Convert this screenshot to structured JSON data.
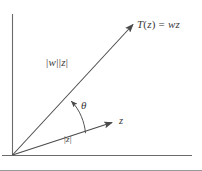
{
  "figure": {
    "type": "geometry-diagram",
    "background_color": "#ffffff",
    "stroke_color": "#5a5a5a",
    "text_color": "#3a3a3a",
    "border": {
      "bottom_rule_color": "#8c8c8c"
    }
  },
  "axes": {
    "origin": {
      "x": 12,
      "y": 155
    },
    "vertical": {
      "name": "imaginary-axis",
      "x": 12,
      "y_top": 14,
      "y_bottom": 155
    },
    "horizontal": {
      "name": "real-axis",
      "y": 155,
      "x_left": 2,
      "x_right": 192
    }
  },
  "vectors": [
    {
      "id": "tz",
      "name": "transformed-vector",
      "label": "T(z) = wz",
      "label_parts": {
        "t": "T",
        "open": "(",
        "z1": "z",
        "close": ")",
        "equals": " = ",
        "w": "w",
        "z2": "z"
      },
      "magnitude_label": "|w| |z|",
      "magnitude_parts": {
        "bar1": "|",
        "w": "w",
        "bar2": "|",
        "bar3": "|",
        "z": "z",
        "bar4": "|"
      },
      "from": {
        "x": 12,
        "y": 155
      },
      "to": {
        "x": 134,
        "y": 24
      }
    },
    {
      "id": "z",
      "name": "original-vector",
      "label": "z",
      "magnitude_label": "|z|",
      "magnitude_parts": {
        "bar1": "|",
        "z": "z",
        "bar2": "|"
      },
      "from": {
        "x": 12,
        "y": 155
      },
      "to": {
        "x": 114,
        "y": 122
      }
    }
  ],
  "angle": {
    "name": "rotation-angle",
    "label": "θ",
    "between": [
      "z",
      "tz"
    ],
    "arc_radius": 72
  }
}
